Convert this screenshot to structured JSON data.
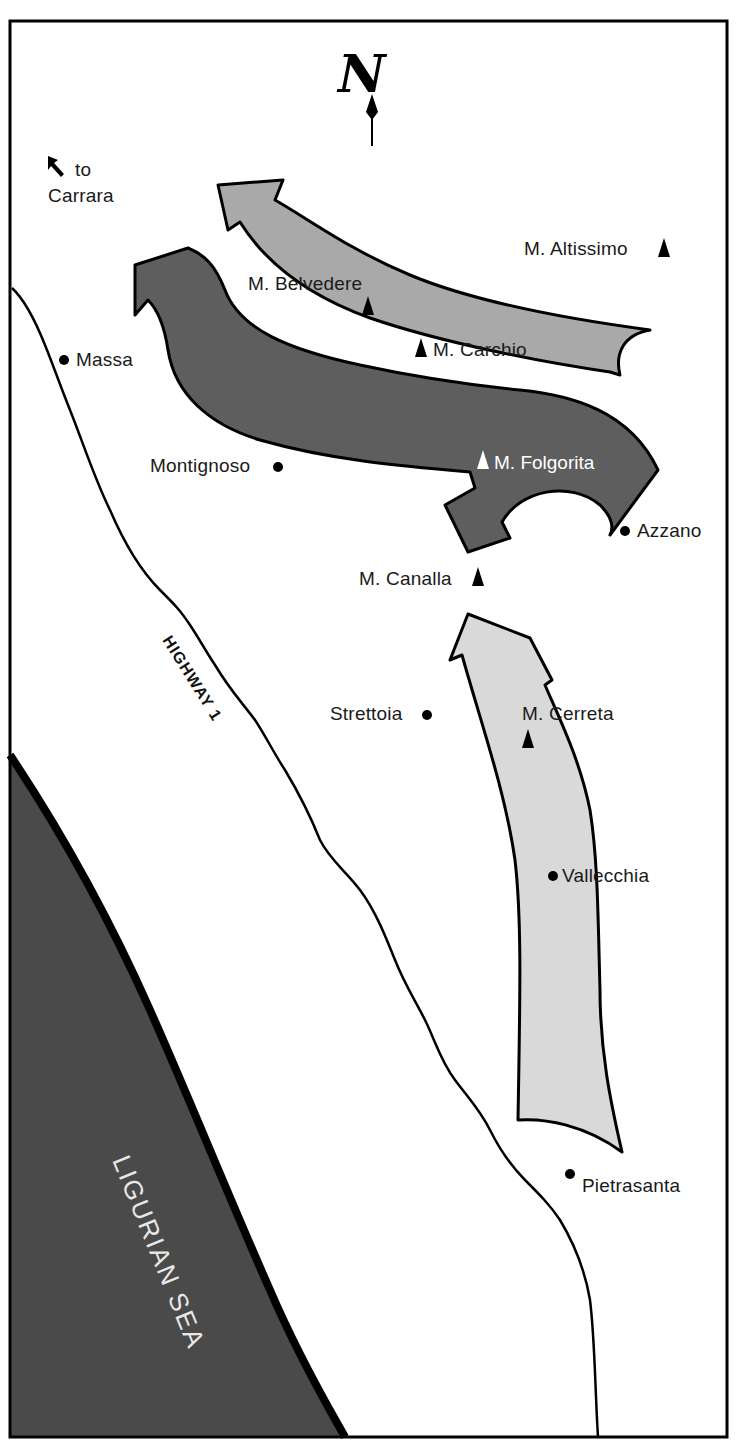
{
  "map": {
    "compass": {
      "label": "N",
      "icon": "north-arrow-icon"
    },
    "direction_note": {
      "line1": "to",
      "line2": "Carrara",
      "icon": "northwest-arrow-icon"
    },
    "sea": {
      "label": "LIGURIAN SEA",
      "color": "#4a4a4a"
    },
    "road": {
      "label": "HIGHWAY 1"
    },
    "arrows": [
      {
        "name": "upper-advance",
        "fill": "#a9a9a9"
      },
      {
        "name": "middle-advance",
        "fill": "#5e5e5e"
      },
      {
        "name": "lower-advance",
        "fill": "#d9d9d9"
      }
    ],
    "peaks": [
      {
        "label": "M. Altissimo"
      },
      {
        "label": "M. Belvedere"
      },
      {
        "label": "M. Carchio"
      },
      {
        "label": "M. Folgorita"
      },
      {
        "label": "M. Canalla"
      },
      {
        "label": "M. Cerreta"
      }
    ],
    "towns": [
      {
        "label": "Massa"
      },
      {
        "label": "Montignoso"
      },
      {
        "label": "Azzano"
      },
      {
        "label": "Strettoia"
      },
      {
        "label": "Vallecchia"
      },
      {
        "label": "Pietrasanta"
      }
    ]
  }
}
